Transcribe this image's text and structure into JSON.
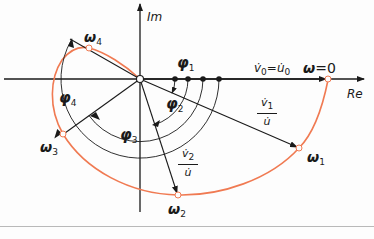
{
  "diagram": {
    "type": "nyquist-locus",
    "axes": {
      "real_label": "Re",
      "imag_label": "Im"
    },
    "colors": {
      "locus": "#f07a52",
      "lines": "#1a1a1a",
      "separator": "#b9b9b9"
    },
    "points": [
      {
        "id": "w0",
        "label": "ω",
        "suffix": "=0"
      },
      {
        "id": "w1",
        "label": "ω",
        "sub": "1"
      },
      {
        "id": "w2",
        "label": "ω",
        "sub": "2"
      },
      {
        "id": "w3",
        "label": "ω",
        "sub": "3"
      },
      {
        "id": "w4",
        "label": "ω",
        "sub": "4"
      }
    ],
    "angles": [
      {
        "label": "φ",
        "sub": "1"
      },
      {
        "label": "φ",
        "sub": "2"
      },
      {
        "label": "φ",
        "sub": "3"
      },
      {
        "label": "φ",
        "sub": "4"
      }
    ],
    "phasors": {
      "v0_eq": {
        "left": "v̇",
        "left_sub": "0",
        "eq": "=",
        "right": "u̇",
        "right_sub": "0"
      },
      "v1_ratio": {
        "num": "v̇",
        "num_sub": "1",
        "den": "u̇"
      },
      "v2_ratio": {
        "num": "v̇",
        "num_sub": "2",
        "den": "u̇"
      }
    }
  }
}
